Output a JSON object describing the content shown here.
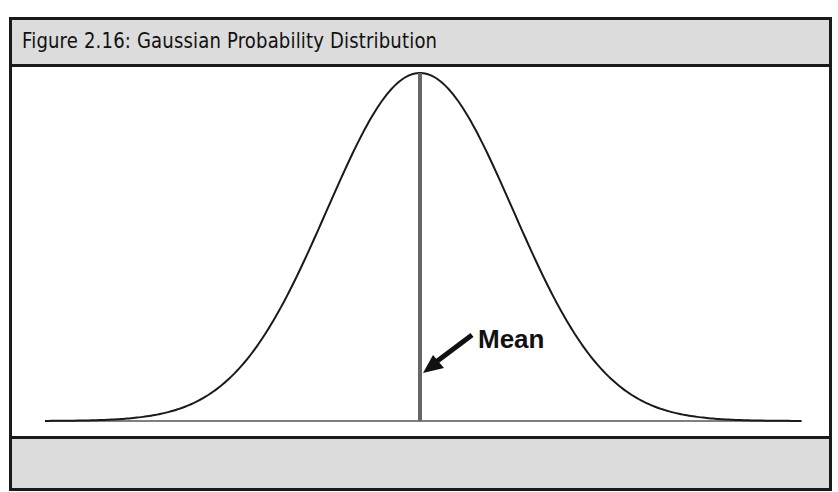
{
  "figure": {
    "title": "Figure 2.16: Gaussian Probability Distribution",
    "footer_text": ""
  },
  "annotation": {
    "label": "Mean",
    "arrow": "arrow-pointing-to-mean-line"
  },
  "chart_data": {
    "type": "line",
    "title": "Figure 2.16: Gaussian Probability Distribution",
    "xlabel": "",
    "ylabel": "",
    "series": [
      {
        "name": "Gaussian probability density",
        "shape": "normal bell curve",
        "mean": 0,
        "sd": 1,
        "x_range_in_sd": [
          -4,
          4
        ]
      }
    ],
    "annotations": [
      {
        "text": "Mean",
        "target": "vertical line at x = mean (peak of curve)"
      }
    ],
    "axes_visible": false,
    "grid": false,
    "legend": "none",
    "colors": {
      "curve": "#1a1a1a",
      "mean_line": "#666666",
      "band": "#dcdcdc"
    }
  }
}
